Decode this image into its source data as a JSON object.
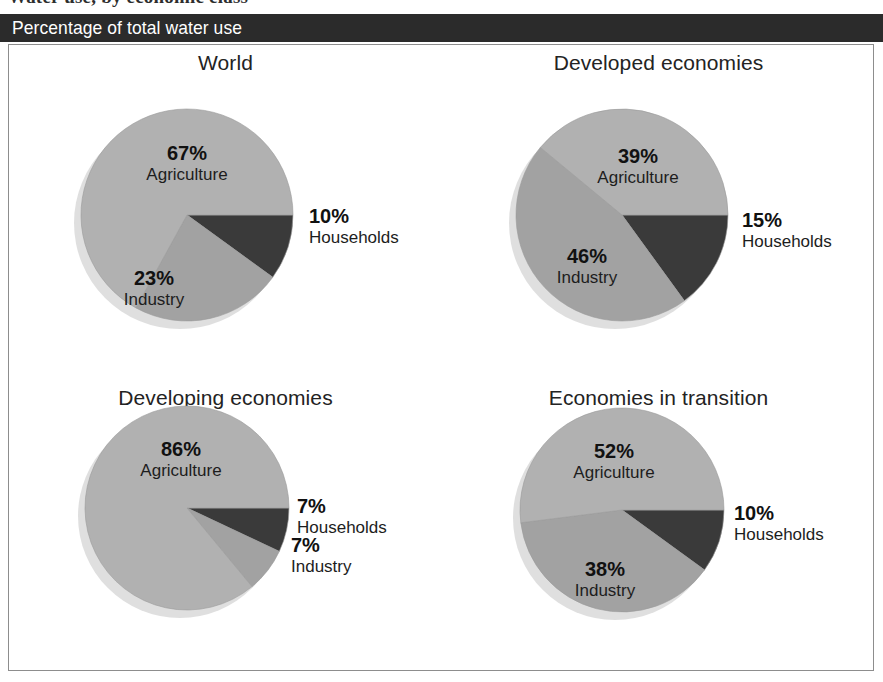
{
  "figure": {
    "supertitle": "Water use, by economic class",
    "band_title": "Percentage of total water use"
  },
  "colors": {
    "band_background": "#2b2b2b",
    "band_text": "#ffffff",
    "panel_border": "#8d8d8d",
    "agriculture": "#b1b1b1",
    "industry": "#a2a2a2",
    "households": "#3a3a3a",
    "shadow": "#d9d9d9",
    "slice_edge": "#9a9a9a"
  },
  "chart_data": {
    "type": "pie",
    "title": "Percentage of total water use",
    "units": "percent",
    "categories": [
      "Agriculture",
      "Industry",
      "Households"
    ],
    "legend_position": "none",
    "note": "Each pie starts at 3 o'clock and is drawn clockwise: Households, Industry, Agriculture.",
    "charts": [
      {
        "title": "World",
        "slices": [
          {
            "label": "Households",
            "pct": 10,
            "pct_text": "10%",
            "color_key": "households",
            "label_placement": "outside"
          },
          {
            "label": "Industry",
            "pct": 23,
            "pct_text": "23%",
            "color_key": "industry",
            "label_placement": "inside"
          },
          {
            "label": "Agriculture",
            "pct": 67,
            "pct_text": "67%",
            "color_key": "agriculture",
            "label_placement": "inside"
          }
        ]
      },
      {
        "title": "Developed economies",
        "slices": [
          {
            "label": "Households",
            "pct": 15,
            "pct_text": "15%",
            "color_key": "households",
            "label_placement": "outside"
          },
          {
            "label": "Industry",
            "pct": 46,
            "pct_text": "46%",
            "color_key": "industry",
            "label_placement": "inside"
          },
          {
            "label": "Agriculture",
            "pct": 39,
            "pct_text": "39%",
            "color_key": "agriculture",
            "label_placement": "inside"
          }
        ]
      },
      {
        "title": "Developing economies",
        "slices": [
          {
            "label": "Households",
            "pct": 7,
            "pct_text": "7%",
            "color_key": "households",
            "label_placement": "outside"
          },
          {
            "label": "Industry",
            "pct": 7,
            "pct_text": "7%",
            "color_key": "industry",
            "label_placement": "outside"
          },
          {
            "label": "Agriculture",
            "pct": 86,
            "pct_text": "86%",
            "color_key": "agriculture",
            "label_placement": "inside"
          }
        ]
      },
      {
        "title": "Economies in transition",
        "slices": [
          {
            "label": "Households",
            "pct": 10,
            "pct_text": "10%",
            "color_key": "households",
            "label_placement": "outside"
          },
          {
            "label": "Industry",
            "pct": 38,
            "pct_text": "38%",
            "color_key": "industry",
            "label_placement": "inside"
          },
          {
            "label": "Agriculture",
            "pct": 52,
            "pct_text": "52%",
            "color_key": "agriculture",
            "label_placement": "inside"
          }
        ]
      }
    ]
  },
  "geometry": {
    "pies": [
      {
        "cx": 178,
        "cy": 170,
        "r": 106,
        "inside_labels": {
          "Agriculture": {
            "x": 178,
            "y": 115
          },
          "Industry": {
            "x": 145,
            "y": 240
          }
        },
        "outside_labels": {
          "Households": {
            "x": 300,
            "y": 178
          }
        }
      },
      {
        "cx": 180,
        "cy": 170,
        "r": 106,
        "inside_labels": {
          "Agriculture": {
            "x": 196,
            "y": 118
          },
          "Industry": {
            "x": 145,
            "y": 218
          }
        },
        "outside_labels": {
          "Households": {
            "x": 300,
            "y": 182
          }
        }
      },
      {
        "cx": 178,
        "cy": 150,
        "r": 102,
        "inside_labels": {
          "Agriculture": {
            "x": 172,
            "y": 98
          }
        },
        "outside_labels": {
          "Households": {
            "x": 288,
            "y": 155
          },
          "Industry": {
            "x": 282,
            "y": 194
          }
        }
      },
      {
        "cx": 180,
        "cy": 152,
        "r": 102,
        "inside_labels": {
          "Agriculture": {
            "x": 172,
            "y": 100
          },
          "Industry": {
            "x": 163,
            "y": 218
          }
        },
        "outside_labels": {
          "Households": {
            "x": 292,
            "y": 162
          }
        }
      }
    ]
  }
}
